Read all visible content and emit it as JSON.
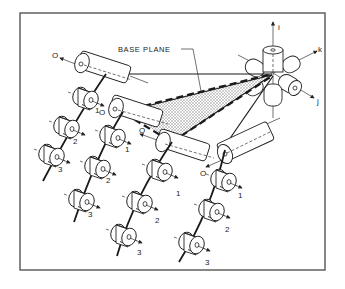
{
  "diagram": {
    "base_plane_label": "BASE PLANE",
    "axes": {
      "i": "i",
      "j": "j",
      "k": "k"
    },
    "link_labels": {
      "zero": "O",
      "one": "1",
      "two": "2",
      "three": "3"
    },
    "colors": {
      "ink": "#222222",
      "frame": "#555555",
      "plane_fill": "#bdbdbd",
      "background": "#ffffff"
    }
  }
}
